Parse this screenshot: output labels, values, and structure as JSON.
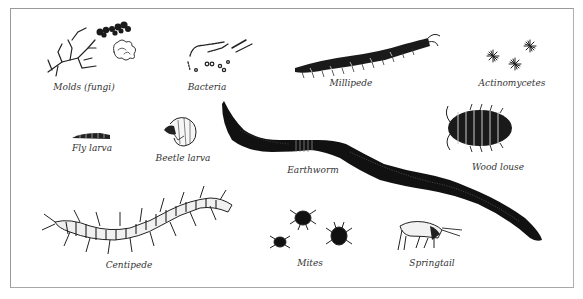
{
  "figure": {
    "title": "",
    "organisms": [
      {
        "id": "molds",
        "label": "Molds (fungi)"
      },
      {
        "id": "bacteria",
        "label": "Bacteria"
      },
      {
        "id": "millipede",
        "label": "Millipede"
      },
      {
        "id": "actinomycetes",
        "label": "Actinomycetes"
      },
      {
        "id": "fly-larva",
        "label": "Fly larva"
      },
      {
        "id": "beetle-larva",
        "label": "Beetle larva"
      },
      {
        "id": "earthworm",
        "label": "Earthworm"
      },
      {
        "id": "wood-louse",
        "label": "Wood louse"
      },
      {
        "id": "centipede",
        "label": "Centipede"
      },
      {
        "id": "mites",
        "label": "Mites"
      },
      {
        "id": "springtail",
        "label": "Springtail"
      }
    ]
  }
}
